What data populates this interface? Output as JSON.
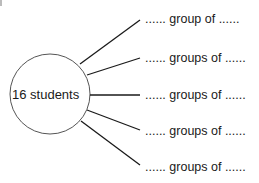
{
  "diagram": {
    "center": {
      "label": "16 students"
    },
    "branches": [
      {
        "text": "...... group of ......"
      },
      {
        "text": "...... groups of ......"
      },
      {
        "text": "...... groups of ......"
      },
      {
        "text": "...... groups of ......"
      },
      {
        "text": "...... groups of ......"
      }
    ],
    "colors": {
      "line": "#1a1a1a",
      "circle": "#555555",
      "background": "#ffffff"
    }
  }
}
